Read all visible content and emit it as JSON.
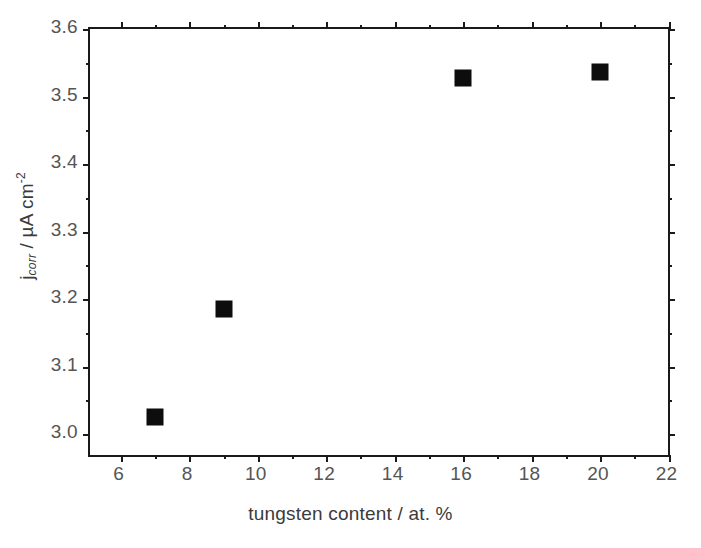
{
  "chart_data": {
    "type": "scatter",
    "title": "",
    "xlabel": "tungsten content / at. %",
    "ylabel_parts": {
      "symbol": "j",
      "subscript": "corr",
      "separator": " / ",
      "unit": "µA cm",
      "superscript": "-2"
    },
    "ylabel": "j_corr / µA cm^-2",
    "xlim": [
      5.1,
      22.1
    ],
    "ylim": [
      2.963,
      3.6
    ],
    "xticks": [
      6,
      8,
      10,
      12,
      14,
      16,
      18,
      20,
      22
    ],
    "xtick_labels": [
      "6",
      "8",
      "10",
      "12",
      "14",
      "16",
      "18",
      "20",
      "22"
    ],
    "x_minor_ticks": [
      5,
      7,
      9,
      11,
      13,
      15,
      17,
      19,
      21,
      22
    ],
    "yticks": [
      3.0,
      3.1,
      3.2,
      3.3,
      3.4,
      3.5,
      3.6
    ],
    "ytick_labels": [
      "3.0",
      "3.1",
      "3.2",
      "3.3",
      "3.4",
      "3.5",
      "3.6"
    ],
    "y_minor_ticks": [
      3.05,
      3.15,
      3.25,
      3.35,
      3.45,
      3.55
    ],
    "grid": false,
    "legend": null,
    "marker": "square",
    "marker_color": "#0d0d0d",
    "marker_size_px": 17,
    "points": [
      {
        "x": 7,
        "y": 3.025
      },
      {
        "x": 9,
        "y": 3.185
      },
      {
        "x": 16,
        "y": 3.528
      },
      {
        "x": 20,
        "y": 3.537
      }
    ],
    "series": [
      {
        "name": "j_corr",
        "x": [
          7,
          9,
          16,
          20
        ],
        "values": [
          3.025,
          3.185,
          3.528,
          3.537
        ]
      }
    ],
    "axis_color": "#1a1a1a",
    "text_color": "#555555",
    "background": "#ffffff"
  }
}
